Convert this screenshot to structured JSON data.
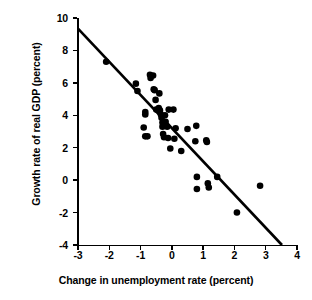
{
  "chart_data": {
    "type": "scatter",
    "title": "",
    "xlabel": "Change in unemployment rate (percent)",
    "ylabel": "Growth rate of real GDP (percent)",
    "xlim": [
      -3,
      4
    ],
    "ylim": [
      -4,
      10
    ],
    "xticks": [
      "-3",
      "-2",
      "-1",
      "0",
      "1",
      "2",
      "3",
      "4"
    ],
    "xtick_values": [
      -3,
      -2,
      -1,
      0,
      1,
      2,
      3,
      4
    ],
    "yticks": [
      "10",
      "8",
      "6",
      "4",
      "2",
      "0",
      "-2",
      "-4"
    ],
    "ytick_values": [
      10,
      8,
      6,
      4,
      2,
      0,
      -2,
      -4
    ],
    "grid": false,
    "legend": null,
    "marker_color": "#000000",
    "marker_size": 4.6,
    "points": [
      {
        "x": -2.1,
        "y": 7.3
      },
      {
        "x": -1.15,
        "y": 5.95
      },
      {
        "x": -1.1,
        "y": 5.5
      },
      {
        "x": -0.85,
        "y": 4.2
      },
      {
        "x": -0.85,
        "y": 4.05
      },
      {
        "x": -0.9,
        "y": 3.25
      },
      {
        "x": -0.85,
        "y": 2.7
      },
      {
        "x": -0.78,
        "y": 2.7
      },
      {
        "x": -0.7,
        "y": 6.5
      },
      {
        "x": -0.68,
        "y": 6.3
      },
      {
        "x": -0.6,
        "y": 6.45
      },
      {
        "x": -0.58,
        "y": 5.6
      },
      {
        "x": -0.55,
        "y": 5.55
      },
      {
        "x": -0.52,
        "y": 4.95
      },
      {
        "x": -0.5,
        "y": 4.35
      },
      {
        "x": -0.42,
        "y": 4.45
      },
      {
        "x": -0.4,
        "y": 5.35
      },
      {
        "x": -0.38,
        "y": 4.3
      },
      {
        "x": -0.35,
        "y": 4.05
      },
      {
        "x": -0.33,
        "y": 3.85
      },
      {
        "x": -0.3,
        "y": 3.55
      },
      {
        "x": -0.3,
        "y": 3.3
      },
      {
        "x": -0.28,
        "y": 2.85
      },
      {
        "x": -0.25,
        "y": 2.65
      },
      {
        "x": -0.22,
        "y": 4.0
      },
      {
        "x": -0.2,
        "y": 3.6
      },
      {
        "x": -0.15,
        "y": 3.3
      },
      {
        "x": -0.12,
        "y": 2.6
      },
      {
        "x": -0.1,
        "y": 4.35
      },
      {
        "x": -0.05,
        "y": 1.95
      },
      {
        "x": 0.05,
        "y": 4.35
      },
      {
        "x": 0.08,
        "y": 2.55
      },
      {
        "x": 0.12,
        "y": 3.2
      },
      {
        "x": 0.3,
        "y": 1.8
      },
      {
        "x": 0.5,
        "y": 3.15
      },
      {
        "x": 0.78,
        "y": 3.35
      },
      {
        "x": 0.75,
        "y": 2.4
      },
      {
        "x": 0.8,
        "y": 0.2
      },
      {
        "x": 0.8,
        "y": -0.55
      },
      {
        "x": 1.1,
        "y": 2.45
      },
      {
        "x": 1.12,
        "y": 2.35
      },
      {
        "x": 1.15,
        "y": -0.2
      },
      {
        "x": 1.18,
        "y": -0.45
      },
      {
        "x": 1.45,
        "y": 0.2
      },
      {
        "x": 2.08,
        "y": -2.0
      },
      {
        "x": 2.82,
        "y": -0.35
      }
    ],
    "fit_line": {
      "name": "regression-line",
      "x_start": -3.0,
      "y_start": 9.35,
      "x_end": 3.52,
      "y_end": -4.0,
      "color": "#000000",
      "width": 2.6
    }
  }
}
